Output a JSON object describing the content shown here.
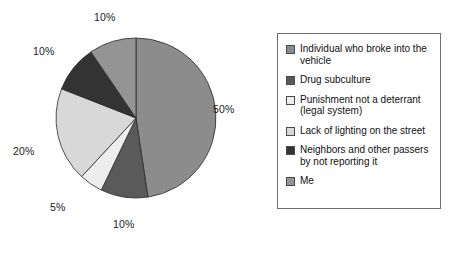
{
  "chart_data": {
    "type": "pie",
    "title": "",
    "categories": [
      "Individual who broke into the vehicle",
      "Drug subculture",
      "Punishment not a deterrant (legal system)",
      "Lack of lighting on the street",
      "Neighbors and other passers by not reporting it",
      "Me"
    ],
    "values": [
      50,
      10,
      5,
      20,
      10,
      10
    ],
    "value_labels": [
      "50%",
      "10%",
      "5%",
      "20%",
      "10%",
      "10%"
    ],
    "colors": [
      "#8c8c8c",
      "#5a5a5a",
      "#ededed",
      "#d8d8d8",
      "#333333",
      "#949494"
    ],
    "start_angle_deg": 0,
    "direction": "clockwise",
    "legend_position": "right",
    "grid": false,
    "xlabel": "",
    "ylabel": ""
  },
  "labels": {
    "slice_50": "50%",
    "slice_10_bottom": "10%",
    "slice_5": "5%",
    "slice_20": "20%",
    "slice_10_upper_left": "10%",
    "slice_10_top": "10%"
  },
  "legend": {
    "items": [
      {
        "label": "Individual who broke into the vehicle",
        "color": "#8c8c8c"
      },
      {
        "label": "Drug subculture",
        "color": "#5a5a5a"
      },
      {
        "label": "Punishment not a deterrant (legal system)",
        "color": "#ededed"
      },
      {
        "label": "Lack of lighting on the street",
        "color": "#d8d8d8"
      },
      {
        "label": "Neighbors and other passers by not reporting it",
        "color": "#333333"
      },
      {
        "label": "Me",
        "color": "#949494"
      }
    ]
  }
}
